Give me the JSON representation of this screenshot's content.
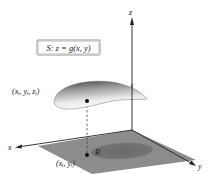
{
  "figure": {
    "surface_label": "S: z = g(x, y)",
    "axes": {
      "x": "x",
      "y": "y",
      "z": "z"
    },
    "point_on_surface_label": "(xᵢ, yᵢ, zᵢ)",
    "point_on_region_label": "(xᵢ, yᵢ)",
    "region_label": "R",
    "colors": {
      "plane": "#8a8a8a",
      "region": "#6e6e6e",
      "surface_dark": "#4a4a4a",
      "surface_light": "#f2f2f2",
      "axis": "#222222",
      "label_box_border": "#7a7a7a"
    }
  }
}
